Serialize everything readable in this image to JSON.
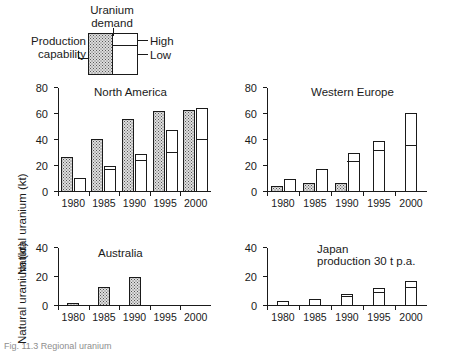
{
  "legend": {
    "title": "Uranium\ndemand",
    "title_line1": "Uranium",
    "title_line2": "demand",
    "production_label_line1": "Production",
    "production_label_line2": "capability",
    "high_label": "High",
    "low_label": "Low"
  },
  "axis": {
    "y_label": "Natural uranium (kt)",
    "categories": [
      "1980",
      "1985",
      "1990",
      "1995",
      "2000"
    ],
    "y_ticks_large": [
      "0",
      "20",
      "40",
      "60",
      "80"
    ],
    "y_ticks_small": [
      "0",
      "20",
      "40"
    ]
  },
  "panels": [
    {
      "key": "north-america",
      "title": "North America",
      "subtitle": ""
    },
    {
      "key": "western-europe",
      "title": "Western Europe",
      "subtitle": ""
    },
    {
      "key": "australia",
      "title": "Australia",
      "subtitle": ""
    },
    {
      "key": "japan",
      "title": "Japan",
      "subtitle": "production 30 t p.a."
    }
  ],
  "caption": "Fig. 11.3 Regional uranium",
  "colors": {
    "ink": "#1a1a1a",
    "production_fill": "#dedede",
    "demand_fill": "#ffffff",
    "stipple_dot": "#555555"
  },
  "chart_data": [
    {
      "type": "bar",
      "title": "North America",
      "xlabel": "",
      "ylabel": "Natural uranium (kt)",
      "ylim": [
        0,
        80
      ],
      "yticks": [
        0,
        20,
        40,
        60,
        80
      ],
      "grid": false,
      "legend": "inset key (top-left of figure)",
      "categories": [
        "1980",
        "1985",
        "1990",
        "1995",
        "2000"
      ],
      "series": [
        {
          "name": "Production capability",
          "values": [
            27,
            41,
            56,
            62,
            63
          ]
        },
        {
          "name": "Uranium demand (high)",
          "values": [
            11,
            20,
            29,
            48,
            65
          ]
        },
        {
          "name": "Uranium demand (low)",
          "values": [
            9,
            16,
            23,
            29,
            39
          ]
        }
      ]
    },
    {
      "type": "bar",
      "title": "Western Europe",
      "xlabel": "",
      "ylabel": "Natural uranium (kt)",
      "ylim": [
        0,
        80
      ],
      "yticks": [
        0,
        20,
        40,
        60,
        80
      ],
      "grid": false,
      "categories": [
        "1980",
        "1985",
        "1990",
        "1995",
        "2000"
      ],
      "series": [
        {
          "name": "Production capability",
          "values": [
            5,
            7,
            7,
            0,
            0
          ]
        },
        {
          "name": "Uranium demand (high)",
          "values": [
            10,
            18,
            30,
            39,
            61
          ]
        },
        {
          "name": "Uranium demand (low)",
          "values": [
            10,
            18,
            22,
            31,
            35
          ]
        }
      ]
    },
    {
      "type": "bar",
      "title": "Australia",
      "xlabel": "",
      "ylabel": "Natural uranium (kt)",
      "ylim": [
        0,
        40
      ],
      "yticks": [
        0,
        20,
        40
      ],
      "grid": false,
      "categories": [
        "1980",
        "1985",
        "1990",
        "1995",
        "2000"
      ],
      "series": [
        {
          "name": "Production capability",
          "values": [
            2,
            13,
            20,
            0,
            0
          ]
        },
        {
          "name": "Uranium demand (high)",
          "values": [
            0,
            0,
            0,
            0,
            0
          ]
        },
        {
          "name": "Uranium demand (low)",
          "values": [
            0,
            0,
            0,
            0,
            0
          ]
        }
      ]
    },
    {
      "type": "bar",
      "title": "Japan",
      "subtitle": "production 30 t p.a.",
      "xlabel": "",
      "ylabel": "Natural uranium (kt)",
      "ylim": [
        0,
        40
      ],
      "yticks": [
        0,
        20,
        40
      ],
      "grid": false,
      "categories": [
        "1980",
        "1985",
        "1990",
        "1995",
        "2000"
      ],
      "series": [
        {
          "name": "Production capability",
          "values": [
            0,
            0,
            0,
            0,
            0
          ]
        },
        {
          "name": "Uranium demand (high)",
          "values": [
            3.5,
            5,
            8,
            12.5,
            17
          ]
        },
        {
          "name": "Uranium demand (low)",
          "values": [
            3.5,
            3.5,
            5.5,
            8.5,
            11.5
          ]
        }
      ]
    }
  ]
}
